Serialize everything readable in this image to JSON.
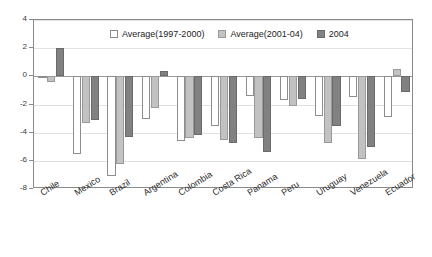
{
  "chart_data": {
    "type": "bar",
    "title": "",
    "subtitle": "",
    "xlabel": "",
    "ylabel": "",
    "ylim": [
      -8,
      4
    ],
    "ytick_step": 2,
    "yticks": [
      4,
      2,
      0,
      -2,
      -4,
      -6,
      -8
    ],
    "grid": true,
    "legend_position": "top-center",
    "categories": [
      "Chile",
      "Mexico",
      "Brazil",
      "Argentina",
      "Colombia",
      "Costa Rica",
      "Panama",
      "Peru",
      "Uruguay",
      "Venezuela",
      "Ecuador"
    ],
    "series": [
      {
        "name": "Average(1997-2000)",
        "color": "#ffffff",
        "values": [
          -0.05,
          -5.5,
          -7.1,
          -3.0,
          -4.6,
          -3.5,
          -1.4,
          -1.65,
          -2.8,
          -1.5,
          -2.9
        ]
      },
      {
        "name": "Average(2001-04)",
        "color": "#c2c2c2",
        "values": [
          -0.4,
          -3.3,
          -6.2,
          -2.25,
          -4.4,
          -4.5,
          -4.4,
          -2.1,
          -4.7,
          -5.9,
          0.5
        ]
      },
      {
        "name": "2004",
        "color": "#818181",
        "values": [
          2.0,
          -3.1,
          -4.3,
          0.35,
          -4.2,
          -4.7,
          -5.4,
          -1.6,
          -3.5,
          -5.0,
          -1.1
        ]
      }
    ]
  },
  "legend": {
    "items": [
      {
        "label": "Average(1997-2000)",
        "swatch": "white-swatch"
      },
      {
        "label": "Average(2001-04)",
        "swatch": "light-gray-swatch"
      },
      {
        "label": "2004",
        "swatch": "dark-gray-swatch"
      }
    ]
  },
  "axes": {
    "y_tick_labels": [
      "4",
      "2",
      "0",
      "-2",
      "-4",
      "-6",
      "-8"
    ]
  },
  "colors": {
    "series_1": "#ffffff",
    "series_2": "#c2c2c2",
    "series_3": "#818181",
    "frame": "#8a8a8a",
    "gridline": "#e2e2e2",
    "zeroline": "#9a9a9a"
  }
}
